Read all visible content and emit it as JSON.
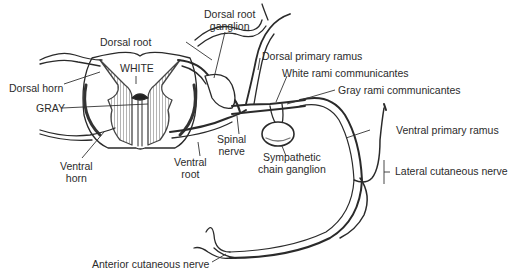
{
  "diagram": {
    "type": "anatomical-illustration",
    "labels": {
      "dorsal_root_ganglion_1": "Dorsal root",
      "dorsal_root_ganglion_2": "ganglion",
      "dorsal_root": "Dorsal root",
      "dorsal_primary_ramus": "Dorsal primary ramus",
      "white_rami": "White rami communicantes",
      "white": "WHITE",
      "dorsal_horn": "Dorsal horn",
      "gray_rami": "Gray rami communicantes",
      "gray": "GRAY",
      "ventral_primary_ramus": "Ventral primary ramus",
      "spinal_nerve_1": "Spinal",
      "spinal_nerve_2": "nerve",
      "ventral_root_1": "Ventral",
      "ventral_root_2": "root",
      "ventral_horn_1": "Ventral",
      "ventral_horn_2": "horn",
      "sympathetic_1": "Sympathetic",
      "sympathetic_2": "chain ganglion",
      "lateral_cutaneous": "Lateral cutaneous nerve",
      "anterior_cutaneous": "Anterior cutaneous nerve"
    },
    "colors": {
      "line": "#2a2a2a",
      "gray_matter": "#8a8a8a",
      "background": "#ffffff"
    }
  }
}
